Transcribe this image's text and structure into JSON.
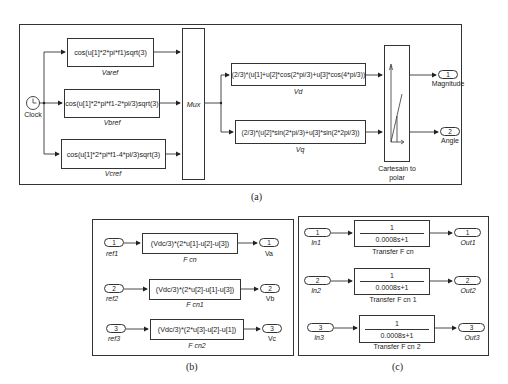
{
  "panel_a": {
    "caption": "(a)",
    "clock": {
      "label": "Clock"
    },
    "fcn_blocks": [
      {
        "expr": "cos(u[1]*2*pi*f1)sqrt(3)",
        "name": "Varef"
      },
      {
        "expr": "cos(u[1]*2*pi*f1-2*pi/3)sqrt(3)",
        "name": "Vbref"
      },
      {
        "expr": "cos(u[1]*2*pi*f1-4*pi/3)sqrt(3)",
        "name": "Vcref"
      }
    ],
    "mux": {
      "label": "Mux"
    },
    "transform_blocks": [
      {
        "expr": "(2/3)*(u[1]+u[2]*cos(2*pi/3)+u[3]*cos(4*pi/3))",
        "name": "Vd"
      },
      {
        "expr": "(2/3)*(u[2]*sin(2*pi/3)+u[3]*sin(2*2pi/3))",
        "name": "Vq"
      }
    ],
    "converter": {
      "label": "Cartesain to polar"
    },
    "outports": [
      {
        "num": "1",
        "name": "Magnitude"
      },
      {
        "num": "2",
        "name": "Angle"
      }
    ]
  },
  "panel_b": {
    "caption": "(b)",
    "rows": [
      {
        "in_num": "1",
        "in_name": "ref1",
        "expr": "(Vdc/3)*(2*u[1]-u[2]-u[3])",
        "block": "F cn",
        "out_num": "1",
        "out_name": "Va"
      },
      {
        "in_num": "2",
        "in_name": "ref2",
        "expr": "(Vdc/3)*(2*u[2]-u[1]-u[3])",
        "block": "F cn1",
        "out_num": "2",
        "out_name": "Vb"
      },
      {
        "in_num": "3",
        "in_name": "ref3",
        "expr": "(Vdc/3)*(2*u[3]-u[2]-u[1])",
        "block": "F cn2",
        "out_num": "3",
        "out_name": "Vc"
      }
    ]
  },
  "panel_c": {
    "caption": "(c)",
    "rows": [
      {
        "in_num": "1",
        "in_name": "In1",
        "numerator": "1",
        "denominator": "0.0008s+1",
        "block": "Transfer F cn",
        "out_num": "1",
        "out_name": "Out1"
      },
      {
        "in_num": "2",
        "in_name": "In2",
        "numerator": "1",
        "denominator": "0.0008s+1",
        "block": "Transfer F cn 1",
        "out_num": "2",
        "out_name": "Out2"
      },
      {
        "in_num": "3",
        "in_name": "In3",
        "numerator": "1",
        "denominator": "0.0008s+1",
        "block": "Transfer F cn 2",
        "out_num": "3",
        "out_name": "Out3"
      }
    ]
  }
}
